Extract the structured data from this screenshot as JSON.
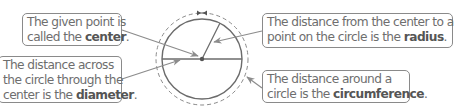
{
  "diagram": {
    "type": "labeled-circle",
    "colors": {
      "line": "#6b6b6b",
      "box_border": "#8a8a8a",
      "text": "#6e6e6e",
      "bold_text": "#555555",
      "arrow": "#8c8c8c"
    },
    "callouts": {
      "center": {
        "line1": "The given point is",
        "line2_prefix": "called the ",
        "term": "center",
        "line2_suffix": "."
      },
      "diameter": {
        "line1": "The distance across",
        "line2": "the circle through the",
        "line3_prefix": "center is the ",
        "term": "diameter",
        "line3_suffix": "."
      },
      "radius": {
        "line1": "The distance from the center to any",
        "line2_prefix": "point on the circle is the ",
        "term": "radius",
        "line2_suffix": "."
      },
      "circumference": {
        "line1": "The distance around a",
        "line2_prefix": "circle is the ",
        "term": "circumference",
        "line2_suffix": "."
      }
    }
  }
}
